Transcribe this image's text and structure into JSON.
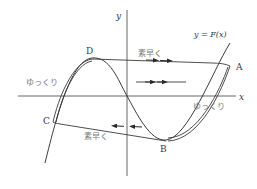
{
  "diagram": {
    "axes": {
      "x_label": "x",
      "y_label": "y"
    },
    "curve_label": "y = F(x)",
    "points": {
      "A": "A",
      "B": "B",
      "C": "C",
      "D": "D"
    },
    "annotations": {
      "fast_top": "素早く",
      "slow_left": "ゆっくり",
      "slow_right": "ゆっくり",
      "fast_bottom": "素早く"
    },
    "colors": {
      "line": "#3a3a3a",
      "text": "#7a7a7a",
      "background": "#ffffff"
    }
  }
}
